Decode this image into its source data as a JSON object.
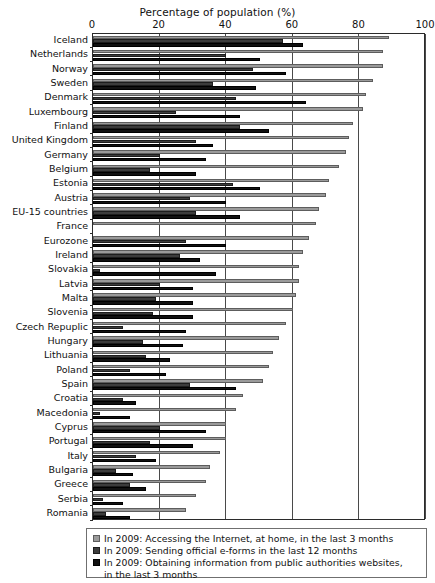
{
  "chart_data": {
    "type": "bar",
    "orientation": "horizontal",
    "title": "Percentage of population (%)",
    "xlabel": "Percentage of population (%)",
    "ylabel": "",
    "xlim": [
      0,
      100
    ],
    "xticks": [
      0,
      20,
      40,
      60,
      80,
      100
    ],
    "grid": true,
    "legend_position": "bottom",
    "categories": [
      "Iceland",
      "Netherlands",
      "Norway",
      "Sweden",
      "Denmark",
      "Luxembourg",
      "Finland",
      "United Kingdom",
      "Germany",
      "Belgium",
      "Estonia",
      "Austria",
      "EU-15 countries",
      "France",
      "Eurozone",
      "Ireland",
      "Slovakia",
      "Latvia",
      "Malta",
      "Slovenia",
      "Czech Repuplic",
      "Hungary",
      "Lithuania",
      "Poland",
      "Spain",
      "Croatia",
      "Macedonia",
      "Cyprus",
      "Portugal",
      "Italy",
      "Bulgaria",
      "Greece",
      "Serbia",
      "Romania"
    ],
    "series": [
      {
        "name": "In 2009: Accessing the Internet, at home, in the last 3 months",
        "color": "#9a9a9a",
        "values": [
          89,
          87,
          87,
          84,
          82,
          81,
          78,
          77,
          76,
          74,
          71,
          70,
          68,
          67,
          65,
          63,
          62,
          62,
          61,
          60,
          58,
          56,
          54,
          53,
          51,
          45,
          43,
          40,
          40,
          38,
          35,
          34,
          31,
          28
        ]
      },
      {
        "name": "In 2009: Sending official e-forms in the last 12 months",
        "color": "#3c3c3c",
        "values": [
          57,
          40,
          48,
          36,
          43,
          25,
          44,
          31,
          20,
          17,
          42,
          29,
          31,
          0,
          28,
          26,
          2,
          20,
          19,
          18,
          9,
          15,
          16,
          11,
          29,
          9,
          2,
          20,
          17,
          13,
          7,
          11,
          3,
          4
        ]
      },
      {
        "name": "In 2009: Obtaining information from public authorities websites, in the last 3 months",
        "color": "#111111",
        "values": [
          63,
          50,
          58,
          49,
          64,
          44,
          53,
          36,
          34,
          31,
          50,
          40,
          44,
          0,
          40,
          32,
          37,
          30,
          30,
          30,
          28,
          27,
          23,
          22,
          43,
          13,
          11,
          34,
          30,
          19,
          12,
          16,
          9,
          11
        ]
      }
    ]
  },
  "legend": {
    "items": [
      {
        "swatch": "s0",
        "line1": "In 2009: Accessing the Internet, at home, in the last 3 months",
        "line2": ""
      },
      {
        "swatch": "s1",
        "line1": "In 2009: Sending official e-forms in the last 12 months",
        "line2": ""
      },
      {
        "swatch": "s2",
        "line1": "In 2009: Obtaining information from public authorities websites,",
        "line2": "in the last 3 months"
      }
    ]
  }
}
